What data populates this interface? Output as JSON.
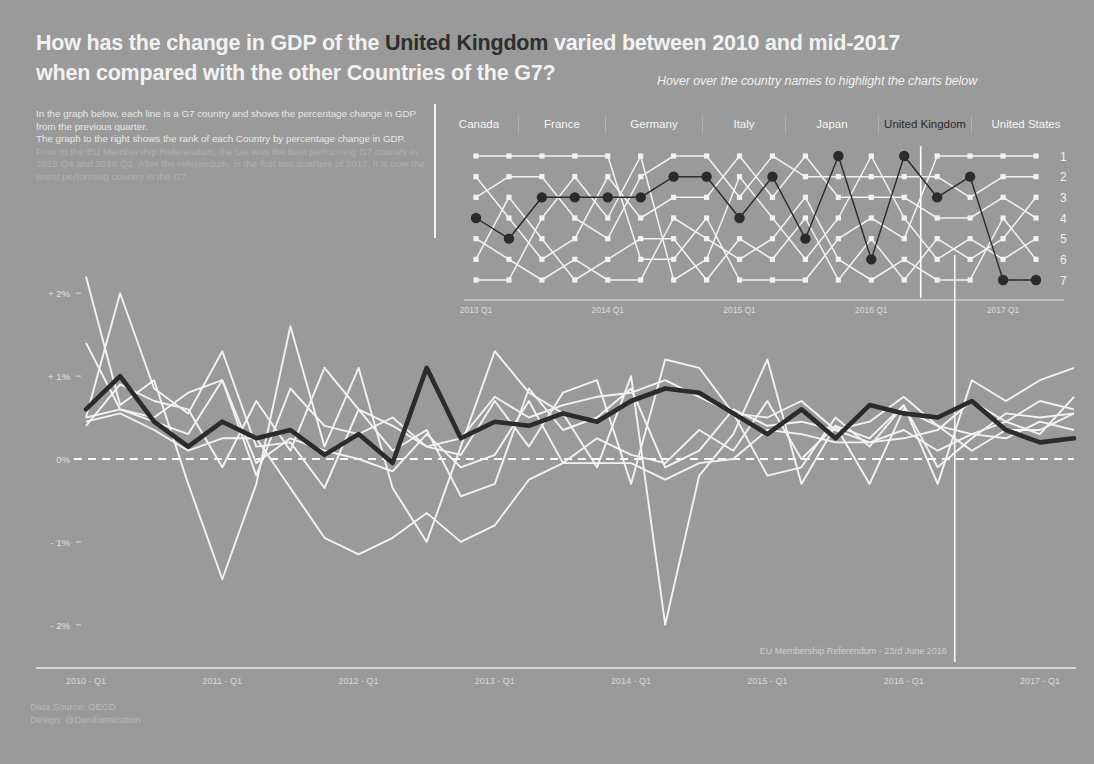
{
  "header": {
    "title_pre": "How has the change in GDP of the ",
    "title_highlight": "United Kingdom",
    "title_post": " varied between 2010 and mid-2017",
    "title_line2": "when compared with the other Countries of the G7?",
    "subtitle": "Hover over the country names to highlight the charts below"
  },
  "intro": {
    "p1": "In the graph below, each line is a G7 country and shows the percentage change in GDP from the previous quarter.",
    "p2": "The graph to the right shows the rank of each Country by percentage change in GDP.",
    "p3": "Prior to the EU Membership Referendum, the UK was the best performing G7 country in 2015 Q4 and 2016 Q2. After the referendum, in the first two quarters of 2017, it is now the worst performing country in the G7."
  },
  "countries": [
    {
      "name": "Canada",
      "active": false
    },
    {
      "name": "France",
      "active": false
    },
    {
      "name": "Germany",
      "active": false
    },
    {
      "name": "Italy",
      "active": false
    },
    {
      "name": "Japan",
      "active": false
    },
    {
      "name": "United Kingdom",
      "active": true
    },
    {
      "name": "United States",
      "active": false
    }
  ],
  "colors": {
    "background": "#9a9a9a",
    "highlight_line": "#2b2b2b",
    "other_line": "#f2f2f2",
    "text": "#f0f0f0",
    "dim_text": "#b0b0b0"
  },
  "annotations": {
    "referendum": "EU Membership Referendum - 23rd June 2016"
  },
  "footer": {
    "source": "Data Source: OECD",
    "design": "Design: @Daniformication"
  },
  "chart_data": [
    {
      "id": "rank-chart",
      "type": "line",
      "title": "",
      "xlabel": "",
      "ylabel": "Rank",
      "grid": false,
      "legend": "none",
      "ylim": [
        1,
        7
      ],
      "y_ticks": [
        1,
        2,
        3,
        4,
        5,
        6,
        7
      ],
      "y_tick_labels": [
        "1",
        "2",
        "3",
        "4",
        "5",
        "6",
        "7"
      ],
      "x": [
        "2013 Q1",
        "2013 Q2",
        "2013 Q3",
        "2013 Q4",
        "2014 Q1",
        "2014 Q2",
        "2014 Q3",
        "2014 Q4",
        "2015 Q1",
        "2015 Q2",
        "2015 Q3",
        "2015 Q4",
        "2016 Q1",
        "2016 Q2",
        "2016 Q3",
        "2016 Q4",
        "2017 Q1",
        "2017 Q2"
      ],
      "x_tick_labels": [
        "2013 Q1",
        "2014 Q1",
        "2015 Q1",
        "2016 Q1",
        "2017 Q1"
      ],
      "x_tick_index": [
        0,
        4,
        8,
        12,
        16
      ],
      "series": [
        {
          "name": "United Kingdom",
          "highlight": true,
          "values": [
            4,
            5,
            3,
            3,
            3,
            3,
            2,
            2,
            4,
            2,
            5,
            1,
            6,
            1,
            3,
            2,
            7,
            7
          ]
        },
        {
          "name": "Canada",
          "highlight": false,
          "values": [
            1,
            1,
            1,
            1,
            1,
            6,
            6,
            4,
            7,
            7,
            7,
            5,
            4,
            5,
            1,
            1,
            1,
            1
          ]
        },
        {
          "name": "France",
          "highlight": false,
          "values": [
            6,
            3,
            5,
            7,
            6,
            5,
            5,
            7,
            5,
            6,
            4,
            7,
            5,
            7,
            5,
            6,
            5,
            3
          ]
        },
        {
          "name": "Germany",
          "highlight": false,
          "values": [
            7,
            7,
            4,
            2,
            4,
            1,
            7,
            6,
            2,
            4,
            6,
            4,
            1,
            4,
            6,
            5,
            6,
            5
          ]
        },
        {
          "name": "Italy",
          "highlight": false,
          "values": [
            5,
            6,
            7,
            6,
            7,
            7,
            4,
            5,
            6,
            5,
            3,
            6,
            7,
            6,
            7,
            7,
            4,
            6
          ]
        },
        {
          "name": "Japan",
          "highlight": false,
          "values": [
            2,
            4,
            6,
            5,
            2,
            4,
            3,
            3,
            1,
            3,
            1,
            3,
            3,
            3,
            4,
            4,
            3,
            4
          ]
        },
        {
          "name": "United States",
          "highlight": false,
          "values": [
            3,
            2,
            2,
            4,
            5,
            2,
            1,
            1,
            3,
            1,
            2,
            2,
            2,
            2,
            2,
            3,
            2,
            2
          ]
        }
      ]
    },
    {
      "id": "main-chart",
      "type": "line",
      "title": "",
      "xlabel": "",
      "ylabel": "% change in GDP from previous quarter",
      "grid": false,
      "legend": "none",
      "ylim": [
        -2.4,
        2.4
      ],
      "y_ticks": [
        2,
        1,
        0,
        -1,
        -2
      ],
      "y_tick_labels": [
        "+ 2%",
        "+ 1%",
        "0%",
        "- 1%",
        "- 2%"
      ],
      "zero_line": 0,
      "x": [
        "2010 Q1",
        "2010 Q2",
        "2010 Q3",
        "2010 Q4",
        "2011 Q1",
        "2011 Q2",
        "2011 Q3",
        "2011 Q4",
        "2012 Q1",
        "2012 Q2",
        "2012 Q3",
        "2012 Q4",
        "2013 Q1",
        "2013 Q2",
        "2013 Q3",
        "2013 Q4",
        "2014 Q1",
        "2014 Q2",
        "2014 Q3",
        "2014 Q4",
        "2015 Q1",
        "2015 Q2",
        "2015 Q3",
        "2015 Q4",
        "2016 Q1",
        "2016 Q2",
        "2016 Q3",
        "2016 Q4",
        "2017 Q1",
        "2017 Q2"
      ],
      "x_tick_labels": [
        "2010 - Q1",
        "2011 - Q1",
        "2012 - Q1",
        "2013 - Q1",
        "2014 - Q1",
        "2015 - Q1",
        "2016 - Q1",
        "2017 - Q1"
      ],
      "x_tick_index": [
        0,
        4,
        8,
        12,
        16,
        20,
        24,
        28
      ],
      "referendum_index": 25.5,
      "series": [
        {
          "name": "United Kingdom",
          "highlight": true,
          "values": [
            0.6,
            1.0,
            0.45,
            0.15,
            0.45,
            0.25,
            0.35,
            0.05,
            0.3,
            -0.05,
            1.1,
            0.25,
            0.45,
            0.4,
            0.55,
            0.45,
            0.7,
            0.85,
            0.8,
            0.55,
            0.3,
            0.6,
            0.25,
            0.65,
            0.55,
            0.5,
            0.7,
            0.35,
            0.2,
            0.25
          ]
        },
        {
          "name": "Canada",
          "highlight": false,
          "values": [
            1.4,
            0.6,
            0.5,
            0.8,
            0.95,
            -0.2,
            0.85,
            0.4,
            0.3,
            0.5,
            0.15,
            0.25,
            0.75,
            0.5,
            0.65,
            0.75,
            0.8,
            0.95,
            0.75,
            0.55,
            -0.2,
            -0.1,
            0.5,
            0.15,
            0.65,
            -0.3,
            0.95,
            0.7,
            0.95,
            1.1
          ]
        },
        {
          "name": "France",
          "highlight": false,
          "values": [
            0.5,
            0.6,
            0.45,
            0.3,
            0.95,
            -0.05,
            0.25,
            0.1,
            0.0,
            -0.15,
            0.3,
            -0.1,
            0.05,
            0.7,
            -0.05,
            0.25,
            0.05,
            -0.05,
            0.35,
            0.1,
            0.7,
            0.0,
            0.4,
            0.25,
            0.65,
            -0.1,
            0.25,
            0.55,
            0.5,
            0.55
          ]
        },
        {
          "name": "Germany",
          "highlight": false,
          "values": [
            0.5,
            2.0,
            0.85,
            0.55,
            1.3,
            0.15,
            0.2,
            -0.35,
            0.6,
            0.1,
            0.35,
            -0.45,
            -0.3,
            0.85,
            0.35,
            0.5,
            0.85,
            -0.1,
            0.1,
            0.6,
            0.4,
            0.45,
            0.35,
            0.45,
            0.75,
            0.4,
            0.3,
            0.45,
            0.7,
            0.6
          ]
        },
        {
          "name": "Italy",
          "highlight": false,
          "values": [
            0.45,
            0.55,
            0.35,
            0.1,
            0.25,
            0.25,
            -0.35,
            -0.95,
            -1.15,
            -0.95,
            -0.65,
            -1.0,
            -0.8,
            -0.25,
            -0.05,
            -0.05,
            -0.05,
            -0.25,
            -0.05,
            0.0,
            0.35,
            0.3,
            0.2,
            0.2,
            0.35,
            0.1,
            0.3,
            0.25,
            0.45,
            0.35
          ]
        },
        {
          "name": "Japan",
          "highlight": false,
          "values": [
            2.2,
            0.65,
            0.95,
            -0.3,
            -1.45,
            -0.3,
            1.6,
            0.15,
            1.1,
            -0.35,
            -1.0,
            0.15,
            1.3,
            0.8,
            0.55,
            -0.1,
            1.0,
            -2.0,
            -0.2,
            0.3,
            1.2,
            -0.3,
            0.4,
            -0.3,
            0.6,
            0.4,
            0.1,
            0.35,
            0.35,
            0.55
          ]
        },
        {
          "name": "United States",
          "highlight": false,
          "values": [
            0.4,
            0.9,
            0.7,
            0.6,
            -0.1,
            0.7,
            0.1,
            1.1,
            0.6,
            0.4,
            0.15,
            0.05,
            0.7,
            0.15,
            0.8,
            0.95,
            -0.3,
            1.2,
            1.1,
            0.55,
            0.5,
            0.7,
            0.35,
            0.2,
            0.25,
            0.35,
            0.7,
            0.45,
            0.3,
            0.75
          ]
        }
      ]
    }
  ]
}
